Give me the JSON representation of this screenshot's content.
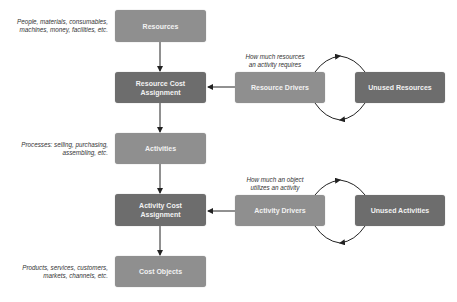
{
  "boxes": {
    "resources": "Resources",
    "resource_cost_assignment": "Resource Cost Assignment",
    "activities": "Activities",
    "activity_cost_assignment": "Activity Cost Assignment",
    "cost_objects": "Cost Objects",
    "resource_drivers": "Resource Drivers",
    "unused_resources": "Unused Resources",
    "activity_drivers": "Activity Drivers",
    "unused_activities": "Unused Activities"
  },
  "notes": {
    "resources_line1": "People, materials, consumables,",
    "resources_line2": "machines, money, facilities, etc.",
    "activities_line1": "Processes: selling, purchasing,",
    "activities_line2": "assembling, etc.",
    "cost_objects_line1": "Products, services, customers,",
    "cost_objects_line2": "markets, channels, etc.",
    "resource_drivers_line1": "How much resources",
    "resource_drivers_line2": "an activity requires",
    "activity_drivers_line1": "How much an object",
    "activity_drivers_line2": "utilizes an activity"
  },
  "colors": {
    "light_box": "#8f8f8f",
    "dark_box": "#6d6d6d",
    "arrow": "#222222"
  }
}
